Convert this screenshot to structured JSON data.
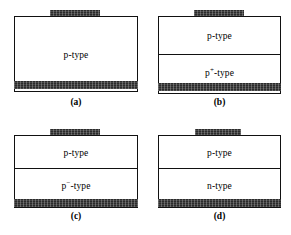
{
  "figure": {
    "kind": "semiconductor-device-cross-sections",
    "colors": {
      "metal_contact": "#2b2b2b",
      "outline": "#111111",
      "background": "#ffffff",
      "text": "#000000"
    },
    "panels": [
      {
        "id": "a",
        "caption": "(a)",
        "top_contact": "metal-contact",
        "bottom_contact": "metal-contact",
        "layers": [
          {
            "label_html": "p-type",
            "label_text": "p-type"
          }
        ]
      },
      {
        "id": "b",
        "caption": "(b)",
        "top_contact": "metal-contact",
        "bottom_contact": "metal-contact",
        "layers": [
          {
            "label_html": "p-type",
            "label_text": "p-type"
          },
          {
            "label_html": "p<sup>+</sup>-type",
            "label_text": "p+-type"
          }
        ]
      },
      {
        "id": "c",
        "caption": "(c)",
        "top_contact": "metal-contact",
        "bottom_contact": "metal-contact",
        "layers": [
          {
            "label_html": "p-type",
            "label_text": "p-type"
          },
          {
            "label_html": "p<sup>&minus;</sup>-type",
            "label_text": "p--type"
          }
        ]
      },
      {
        "id": "d",
        "caption": "(d)",
        "top_contact": "metal-contact",
        "bottom_contact": "metal-contact",
        "layers": [
          {
            "label_html": "p-type",
            "label_text": "p-type"
          },
          {
            "label_html": "n-type",
            "label_text": "n-type"
          }
        ]
      }
    ]
  }
}
